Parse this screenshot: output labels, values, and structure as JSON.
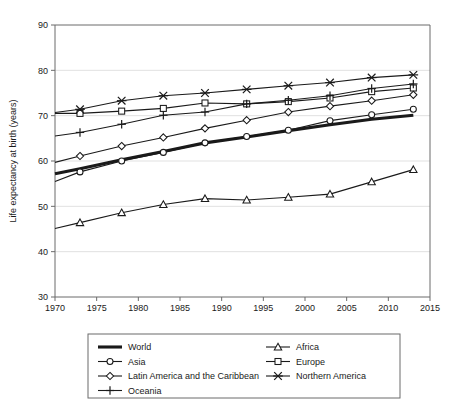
{
  "chart_data": {
    "type": "line",
    "title": "",
    "xlabel": "",
    "ylabel": "Life expectancy at birth (years)",
    "xlim": [
      1970,
      2015
    ],
    "ylim": [
      30,
      90
    ],
    "xticks": [
      1970,
      1975,
      1980,
      1985,
      1990,
      1995,
      2000,
      2005,
      2010,
      2015
    ],
    "yticks": [
      30,
      40,
      50,
      60,
      70,
      80,
      90
    ],
    "grid": true,
    "legend_position": "bottom",
    "x": [
      1970,
      1973,
      1978,
      1983,
      1988,
      1993,
      1998,
      2003,
      2008,
      2013
    ],
    "series": [
      {
        "name": "World",
        "marker": "none",
        "values": [
          57.2,
          58.3,
          60.3,
          62.1,
          64.0,
          65.3,
          66.7,
          68.0,
          69.2,
          70.1
        ]
      },
      {
        "name": "Africa",
        "marker": "triangle",
        "values": [
          45.1,
          46.4,
          48.6,
          50.4,
          51.7,
          51.4,
          52.0,
          52.7,
          55.4,
          58.1
        ]
      },
      {
        "name": "Asia",
        "marker": "circle",
        "values": [
          55.5,
          57.6,
          60.0,
          61.9,
          64.0,
          65.4,
          66.8,
          68.9,
          70.2,
          71.4
        ]
      },
      {
        "name": "Europe",
        "marker": "square",
        "values": [
          70.5,
          70.5,
          71.0,
          71.6,
          72.8,
          72.6,
          73.1,
          73.9,
          75.3,
          76.1
        ]
      },
      {
        "name": "Latin America and the Caribbean",
        "marker": "diamond",
        "values": [
          59.7,
          61.1,
          63.3,
          65.2,
          67.2,
          69.0,
          70.8,
          72.1,
          73.3,
          74.6
        ]
      },
      {
        "name": "Northern America",
        "marker": "cross-x",
        "values": [
          70.7,
          71.4,
          73.3,
          74.4,
          75.0,
          75.8,
          76.6,
          77.3,
          78.4,
          79.0
        ]
      },
      {
        "name": "Oceania",
        "marker": "plus",
        "values": [
          65.5,
          66.3,
          68.1,
          70.1,
          70.8,
          72.6,
          73.4,
          74.4,
          76.0,
          77.0
        ]
      }
    ]
  },
  "legend": {
    "entries": [
      {
        "label": "World",
        "marker": "none"
      },
      {
        "label": "Africa",
        "marker": "triangle"
      },
      {
        "label": "Asia",
        "marker": "circle"
      },
      {
        "label": "Europe",
        "marker": "square"
      },
      {
        "label": "Latin America and the Caribbean",
        "marker": "diamond"
      },
      {
        "label": "Northern America",
        "marker": "cross-x"
      },
      {
        "label": "Oceania",
        "marker": "plus"
      }
    ]
  },
  "colors": {
    "line": "#1a1a1a",
    "axis": "#6b6b6b",
    "grid": "#d9d9d9",
    "marker_fill": "#ffffff",
    "background": "#ffffff"
  }
}
